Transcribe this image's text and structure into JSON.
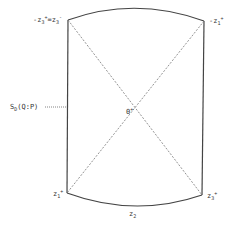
{
  "diagram": {
    "vertices": {
      "top_left": {
        "label": "-z",
        "sub": "3",
        "sup": "+",
        "label2": "=z",
        "sub2": "3",
        "sup2": "-"
      },
      "top_right": {
        "label": "-z",
        "sub": "1",
        "sup": "+"
      },
      "bottom_left": {
        "label": "z",
        "sub": "1",
        "sup": "+"
      },
      "bottom_right": {
        "label": "z",
        "sub": "3",
        "sup": "+"
      }
    },
    "center": {
      "label": "0",
      "sup": "+"
    },
    "bottom_edge": {
      "label": "z",
      "sub": "2"
    },
    "left_edge_annotation": {
      "label": "S",
      "sub": "D",
      "rest": "(Q:P)"
    }
  }
}
